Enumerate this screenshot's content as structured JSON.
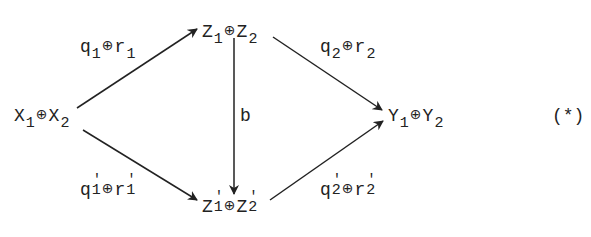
{
  "diagram": {
    "type": "commutative-diagram",
    "equation_tag": "(*)",
    "colors": {
      "ink": "#222222",
      "background": "#ffffff"
    },
    "nodes": {
      "x": {
        "base1": "X",
        "sub1": "1",
        "op": "⊕",
        "base2": "X",
        "sub2": "2"
      },
      "z": {
        "base1": "Z",
        "sub1": "1",
        "op": "⊕",
        "base2": "Z",
        "sub2": "2"
      },
      "zp": {
        "base1": "Z",
        "prime1": "'",
        "sub1": "1",
        "op": "⊕",
        "base2": "Z",
        "prime2": "'",
        "sub2": "2"
      },
      "y": {
        "base1": "Y",
        "sub1": "1",
        "op": "⊕",
        "base2": "Y",
        "sub2": "2"
      }
    },
    "edges": {
      "x_to_z": {
        "from": "X1⊕X2",
        "to": "Z1⊕Z2",
        "base1": "q",
        "sub1": "1",
        "op": "⊕",
        "base2": "r",
        "sub2": "1"
      },
      "x_to_zp": {
        "from": "X1⊕X2",
        "to": "Z'1⊕Z'2",
        "base1": "q",
        "prime1": "'",
        "sub1": "1",
        "op": "⊕",
        "base2": "r",
        "prime2": "'",
        "sub2": "1"
      },
      "z_to_zp": {
        "from": "Z1⊕Z2",
        "to": "Z'1⊕Z'2",
        "label": "b"
      },
      "z_to_y": {
        "from": "Z1⊕Z2",
        "to": "Y1⊕Y2",
        "base1": "q",
        "sub1": "2",
        "op": "⊕",
        "base2": "r",
        "sub2": "2"
      },
      "zp_to_y": {
        "from": "Z'1⊕Z'2",
        "to": "Y1⊕Y2",
        "base1": "q",
        "prime1": "'",
        "sub1": "2",
        "op": "⊕",
        "base2": "r",
        "prime2": "'",
        "sub2": "2"
      }
    }
  }
}
